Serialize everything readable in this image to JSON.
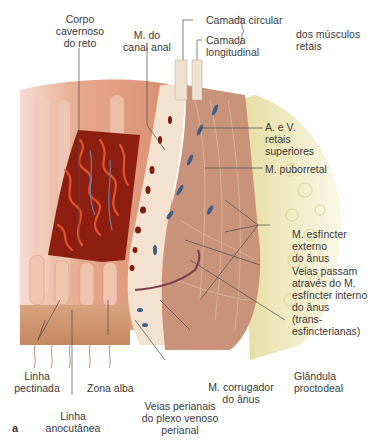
{
  "figure": {
    "panel_letter": "a",
    "labels": {
      "corpo_cavernoso": "Corpo\ncavernoso\ndo reto",
      "m_canal_anal": "M. do\ncanal anal",
      "camada_circular": "Camada circular",
      "camada_longitudinal": "Camada\nlongitudinal",
      "dos_musculos_retais": "dos músculos\nretais",
      "a_v_retais": "A. e V.\nretais\nsuperiores",
      "m_puborretal": "M. puborretal",
      "m_esfincter_externo": "M. esfíncter\nexterno\ndo ânus",
      "veias_passam": "Veias passam\natravés do M.\nesfíncter interno\ndo ânus\n(trans-\nesfincterianas)",
      "glandula": "Glândula\nproctodeal",
      "m_corrugador": "M. corrugador\ndo ânus",
      "veias_perianais": "Veias perianais\ndo plexo venoso\nperianal",
      "linha_pectinada": "Linha\npectinada",
      "zona_alba": "Zona  alba",
      "linha_anocutanea": "Linha\nanocutânea"
    },
    "colors": {
      "mucosa": "#e7a98c",
      "cavernous": "#b8321c",
      "muscle": "#c8937a",
      "fat": "#e8e0a8",
      "vein": "#3e5d86",
      "leader": "#4a4a4a"
    }
  }
}
